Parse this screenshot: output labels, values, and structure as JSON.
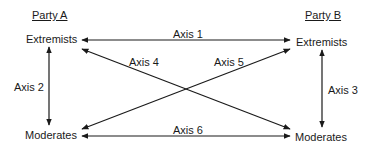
{
  "diagram": {
    "parties": [
      {
        "name": "Party A",
        "top_node": "Extremists",
        "bottom_node": "Moderates"
      },
      {
        "name": "Party B",
        "top_node": "Extremists",
        "bottom_node": "Moderates"
      }
    ],
    "axes": [
      {
        "label": "Axis 1",
        "from": "Party A Extremists",
        "to": "Party B Extremists",
        "bidirectional": true
      },
      {
        "label": "Axis 2",
        "from": "Party A Extremists",
        "to": "Party A Moderates",
        "bidirectional": true
      },
      {
        "label": "Axis 3",
        "from": "Party B Extremists",
        "to": "Party B Moderates",
        "bidirectional": true
      },
      {
        "label": "Axis 4",
        "from": "Party A Extremists",
        "to": "Party B Moderates",
        "bidirectional": true
      },
      {
        "label": "Axis 5",
        "from": "Party B Extremists",
        "to": "Party A Moderates",
        "bidirectional": true
      },
      {
        "label": "Axis 6",
        "from": "Party A Moderates",
        "to": "Party B Moderates",
        "bidirectional": true
      }
    ],
    "line_color": "#1a1a1a"
  }
}
